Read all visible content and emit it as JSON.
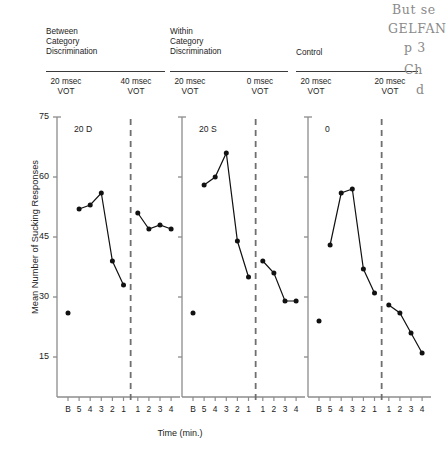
{
  "figure": {
    "headers": [
      {
        "name": "between-category",
        "text": "Between\nCategory\nDiscrimination"
      },
      {
        "name": "within-category",
        "text": "Within\nCategory\nDiscrimination"
      },
      {
        "name": "control",
        "text": "Control"
      }
    ],
    "conditions": [
      {
        "text": "20 msec\nVOT"
      },
      {
        "text": "40 msec\nVOT"
      },
      {
        "text": "20 msec\nVOT"
      },
      {
        "text": "0 msec\nVOT"
      },
      {
        "text": "20 msec\nVOT"
      },
      {
        "text": "20 msec\nVOT"
      }
    ],
    "panel_tags": [
      "20 D",
      "20 S",
      "0"
    ],
    "handwriting": [
      "But se",
      "GELFAN",
      "p 3",
      "Ch",
      "d"
    ]
  },
  "chart_data": {
    "type": "line",
    "title": "",
    "xlabel": "Time (min.)",
    "ylabel": "Mean Number of Sucking Responses",
    "ylim": [
      5,
      75
    ],
    "yticks": [
      15,
      30,
      45,
      60,
      75
    ],
    "x_tick_labels": [
      "B",
      "5",
      "4",
      "3",
      "2",
      "1",
      "1",
      "2",
      "3",
      "4"
    ],
    "grid": false,
    "legend": "none",
    "shift_marker": "dashed vertical line between pre-shift minute 1 and post-shift minute 1",
    "panels": [
      {
        "name": "between-category-discrimination",
        "tag": "20 D",
        "pre_condition": "20 msec VOT",
        "post_condition": "40 msec VOT",
        "baseline": {
          "x": "B",
          "y": 26
        },
        "pre_shift": {
          "x": [
            "5",
            "4",
            "3",
            "2",
            "1"
          ],
          "y": [
            52,
            53,
            56,
            39,
            33
          ]
        },
        "post_shift": {
          "x": [
            "1",
            "2",
            "3",
            "4"
          ],
          "y": [
            51,
            47,
            48,
            47
          ]
        }
      },
      {
        "name": "within-category-discrimination",
        "tag": "20 S",
        "pre_condition": "20 msec VOT",
        "post_condition": "0 msec VOT",
        "baseline": {
          "x": "B",
          "y": 26
        },
        "pre_shift": {
          "x": [
            "5",
            "4",
            "3",
            "2",
            "1"
          ],
          "y": [
            58,
            60,
            66,
            44,
            35
          ]
        },
        "post_shift": {
          "x": [
            "1",
            "2",
            "3",
            "4"
          ],
          "y": [
            39,
            36,
            29,
            29
          ]
        }
      },
      {
        "name": "control",
        "tag": "0",
        "pre_condition": "20 msec VOT",
        "post_condition": "20 msec VOT",
        "baseline": {
          "x": "B",
          "y": 24
        },
        "pre_shift": {
          "x": [
            "5",
            "4",
            "3",
            "2",
            "1"
          ],
          "y": [
            43,
            56,
            57,
            37,
            31
          ]
        },
        "post_shift": {
          "x": [
            "1",
            "2",
            "3",
            "4"
          ],
          "y": [
            28,
            26,
            21,
            16
          ]
        }
      }
    ]
  }
}
